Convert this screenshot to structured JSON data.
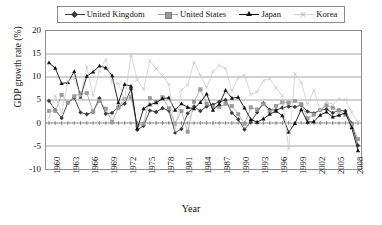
{
  "chart_data": {
    "type": "line",
    "title": "",
    "xlabel": "Year",
    "ylabel": "GDP growth rate (%)",
    "ylim": [
      -10,
      20
    ],
    "yticks": [
      20,
      15,
      10,
      5,
      0,
      -5,
      -10
    ],
    "xlim": [
      1960,
      2009
    ],
    "xticks": [
      1960,
      1963,
      1966,
      1969,
      1972,
      1975,
      1978,
      1981,
      1984,
      1987,
      1990,
      1993,
      1996,
      1999,
      2002,
      2005,
      2008
    ],
    "grid": "horizontal",
    "legend_position": "top",
    "x": [
      1960,
      1961,
      1962,
      1963,
      1964,
      1965,
      1966,
      1967,
      1968,
      1969,
      1970,
      1971,
      1972,
      1973,
      1974,
      1975,
      1976,
      1977,
      1978,
      1979,
      1980,
      1981,
      1982,
      1983,
      1984,
      1985,
      1986,
      1987,
      1988,
      1989,
      1990,
      1991,
      1992,
      1993,
      1994,
      1995,
      1996,
      1997,
      1998,
      1999,
      2000,
      2001,
      2002,
      2003,
      2004,
      2005,
      2006,
      2007,
      2008,
      2009
    ],
    "series": [
      {
        "name": "United Kingdom",
        "color": "#3a3a3a",
        "marker": "diamond",
        "values": [
          4.8,
          2.8,
          1.1,
          4.4,
          5.5,
          2.3,
          1.9,
          2.4,
          5.4,
          2.0,
          2.2,
          3.5,
          4.2,
          7.4,
          -1.5,
          -0.6,
          2.7,
          2.4,
          3.2,
          2.7,
          -2.1,
          -1.3,
          2.1,
          3.6,
          2.6,
          3.6,
          4.0,
          4.6,
          5.0,
          2.2,
          0.8,
          -1.4,
          0.2,
          2.3,
          4.3,
          2.9,
          2.8,
          3.3,
          3.6,
          3.5,
          3.9,
          2.5,
          2.1,
          2.8,
          3.0,
          2.2,
          2.8,
          2.6,
          -0.1,
          -4.9
        ]
      },
      {
        "name": "United States",
        "color": "#9a9a9a",
        "marker": "square",
        "values": [
          2.6,
          2.6,
          6.1,
          4.4,
          5.8,
          6.4,
          6.5,
          2.5,
          4.8,
          3.1,
          0.2,
          3.3,
          5.2,
          5.6,
          -0.5,
          -0.2,
          5.4,
          4.6,
          5.6,
          3.2,
          -0.2,
          2.6,
          -1.9,
          4.6,
          7.3,
          4.2,
          3.5,
          3.5,
          4.2,
          3.7,
          1.9,
          -0.2,
          3.4,
          2.9,
          4.1,
          2.5,
          3.7,
          4.5,
          4.4,
          4.8,
          4.1,
          1.0,
          1.8,
          2.8,
          3.8,
          3.3,
          2.7,
          1.8,
          -0.3,
          -3.5
        ]
      },
      {
        "name": "Japan",
        "color": "#111111",
        "marker": "triangle",
        "values": [
          13.1,
          11.9,
          8.6,
          8.8,
          11.2,
          5.7,
          10.2,
          11.1,
          12.4,
          12.0,
          10.3,
          4.4,
          8.4,
          8.0,
          -1.2,
          3.1,
          4.0,
          4.4,
          5.3,
          5.5,
          2.8,
          4.2,
          3.4,
          3.1,
          4.5,
          6.3,
          2.8,
          4.1,
          7.1,
          5.4,
          5.6,
          3.3,
          0.8,
          0.2,
          0.9,
          1.9,
          2.6,
          1.6,
          -2.0,
          -0.1,
          2.9,
          0.2,
          0.3,
          1.7,
          2.4,
          1.3,
          1.7,
          2.2,
          -1.0,
          -6.0
        ]
      },
      {
        "name": "Korea",
        "color": "#c8c8c8",
        "marker": "x",
        "values": [
          1.2,
          5.9,
          2.1,
          9.1,
          9.7,
          5.8,
          12.2,
          5.9,
          11.3,
          13.8,
          8.8,
          8.6,
          5.1,
          14.8,
          9.4,
          7.3,
          13.5,
          11.8,
          10.3,
          8.4,
          -1.7,
          7.2,
          8.3,
          13.2,
          10.4,
          7.7,
          11.2,
          12.5,
          11.9,
          7.0,
          9.8,
          10.4,
          6.2,
          6.8,
          9.2,
          9.6,
          7.6,
          5.9,
          -5.7,
          10.7,
          8.8,
          4.0,
          7.2,
          2.8,
          4.6,
          4.0,
          5.2,
          5.1,
          2.3,
          0.2
        ]
      }
    ]
  },
  "legend": {
    "items": [
      {
        "label": "United Kingdom",
        "marker": "diamond-marker"
      },
      {
        "label": "United States",
        "marker": "square-marker"
      },
      {
        "label": "Japan",
        "marker": "triangle-marker"
      },
      {
        "label": "Korea",
        "marker": "x-marker"
      }
    ]
  },
  "axes": {
    "y_title": "GDP growth rate (%)",
    "x_title": "Year",
    "y_ticks": [
      "20",
      "15",
      "10",
      "5",
      "0",
      "-5",
      "-10"
    ],
    "x_ticks": [
      "1960",
      "1963",
      "1966",
      "1969",
      "1972",
      "1975",
      "1978",
      "1981",
      "1984",
      "1987",
      "1990",
      "1993",
      "1996",
      "1999",
      "2002",
      "2005",
      "2008"
    ]
  }
}
